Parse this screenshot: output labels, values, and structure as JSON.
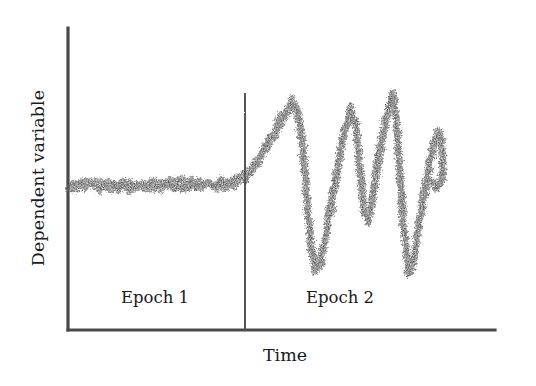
{
  "figure": {
    "background_color": "#ffffff",
    "ink_color": "#555555",
    "axis_color": "#4a4a4a",
    "data_color": "#5a5a5a"
  },
  "labels": {
    "ylabel": "Dependent variable",
    "xlabel": "Time",
    "epoch1": "Epoch 1",
    "epoch2": "Epoch 2"
  },
  "chart_data": {
    "type": "line",
    "title": "",
    "xlabel": "Time",
    "ylabel": "Dependent variable",
    "grid": false,
    "legend": null,
    "axes": {
      "x_axis_px": {
        "y": 330,
        "x_start": 68,
        "x_end": 495
      },
      "y_axis_px": {
        "x": 68,
        "y_start": 28,
        "y_end": 330
      },
      "x_tick_labels": [],
      "y_tick_labels": [],
      "xlim": [
        0,
        100
      ],
      "ylim": [
        0,
        100
      ]
    },
    "annotations": [
      {
        "name": "epoch-divider",
        "type": "vline",
        "x": 41.4,
        "x_px": 245,
        "y_top_px": 93,
        "y_bottom_px": 330,
        "label": "boundary between Epoch 1 and Epoch 2"
      },
      {
        "name": "epoch1-region-label",
        "text": "Epoch 1",
        "x_px": 155,
        "y_px": 300
      },
      {
        "name": "epoch2-region-label",
        "text": "Epoch 2",
        "x_px": 340,
        "y_px": 300
      }
    ],
    "series": [
      {
        "name": "dependent-variable",
        "style": "noisy-scatter-band",
        "noise_amplitude_px": 5.5,
        "stroke_width_px": 6,
        "description": "Flat stable noisy baseline during Epoch 1, then large damped-looking oscillations during Epoch 2",
        "control_points_px": [
          {
            "x": 70,
            "y": 186
          },
          {
            "x": 100,
            "y": 186
          },
          {
            "x": 130,
            "y": 185
          },
          {
            "x": 160,
            "y": 185
          },
          {
            "x": 190,
            "y": 184
          },
          {
            "x": 215,
            "y": 184
          },
          {
            "x": 235,
            "y": 182
          },
          {
            "x": 245,
            "y": 178
          },
          {
            "x": 252,
            "y": 170
          },
          {
            "x": 260,
            "y": 158
          },
          {
            "x": 268,
            "y": 145
          },
          {
            "x": 276,
            "y": 130
          },
          {
            "x": 284,
            "y": 113
          },
          {
            "x": 292,
            "y": 103
          },
          {
            "x": 298,
            "y": 112
          },
          {
            "x": 303,
            "y": 150
          },
          {
            "x": 307,
            "y": 200
          },
          {
            "x": 311,
            "y": 245
          },
          {
            "x": 315,
            "y": 268
          },
          {
            "x": 320,
            "y": 262
          },
          {
            "x": 326,
            "y": 235
          },
          {
            "x": 332,
            "y": 200
          },
          {
            "x": 338,
            "y": 163
          },
          {
            "x": 345,
            "y": 128
          },
          {
            "x": 351,
            "y": 110
          },
          {
            "x": 356,
            "y": 125
          },
          {
            "x": 360,
            "y": 170
          },
          {
            "x": 364,
            "y": 210
          },
          {
            "x": 368,
            "y": 218
          },
          {
            "x": 373,
            "y": 196
          },
          {
            "x": 378,
            "y": 162
          },
          {
            "x": 384,
            "y": 128
          },
          {
            "x": 389,
            "y": 104
          },
          {
            "x": 393,
            "y": 95
          },
          {
            "x": 397,
            "y": 130
          },
          {
            "x": 401,
            "y": 190
          },
          {
            "x": 405,
            "y": 240
          },
          {
            "x": 409,
            "y": 270
          },
          {
            "x": 413,
            "y": 262
          },
          {
            "x": 418,
            "y": 232
          },
          {
            "x": 424,
            "y": 196
          },
          {
            "x": 430,
            "y": 162
          },
          {
            "x": 436,
            "y": 138
          },
          {
            "x": 440,
            "y": 133
          },
          {
            "x": 442,
            "y": 150
          },
          {
            "x": 443,
            "y": 172
          },
          {
            "x": 441,
            "y": 182
          },
          {
            "x": 437,
            "y": 184
          },
          {
            "x": 431,
            "y": 182
          }
        ]
      }
    ]
  }
}
